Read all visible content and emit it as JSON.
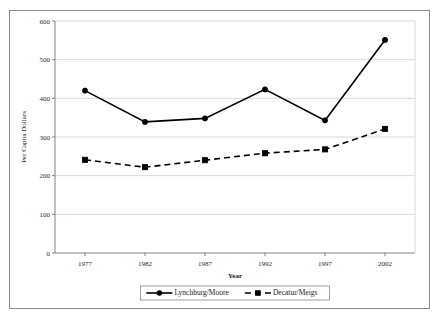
{
  "chart_data": {
    "type": "line",
    "title": "",
    "xlabel": "Year",
    "ylabel": "Per Capita Dollars",
    "categories": [
      "1977",
      "1982",
      "1987",
      "1992",
      "1997",
      "2002"
    ],
    "x": [
      1977,
      1982,
      1987,
      1992,
      1997,
      2002
    ],
    "ylim": [
      0,
      600
    ],
    "yticks": [
      0,
      100,
      200,
      300,
      400,
      500,
      600
    ],
    "ytick_labels": [
      "0",
      "100",
      "200",
      "300",
      "400",
      "500",
      "600"
    ],
    "grid": "horizontal",
    "legend_position": "bottom-center",
    "series": [
      {
        "name": "Lynchburg/Moore",
        "values": [
          420,
          339,
          348,
          423,
          343,
          551
        ],
        "line_style": "solid",
        "marker": "circle",
        "color": "#000000"
      },
      {
        "name": "Decatur/Meigs",
        "values": [
          241,
          222,
          240,
          258,
          268,
          321
        ],
        "line_style": "dashed",
        "marker": "square",
        "color": "#000000"
      }
    ]
  },
  "legend": {
    "entries": [
      {
        "label": "Lynchburg/Moore"
      },
      {
        "label": "Decatur/Meigs"
      }
    ]
  },
  "colors": {
    "line": "#000000",
    "grid": "#d9d9d9",
    "axis": "#808080",
    "frame": "#8a8a8a",
    "text": "#1a1a1a",
    "background": "#ffffff"
  }
}
